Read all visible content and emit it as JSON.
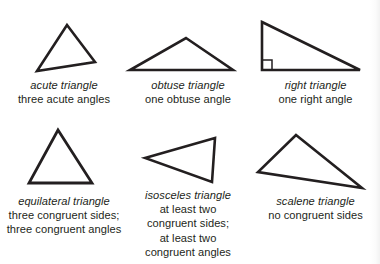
{
  "figure": {
    "ink_color": "#231f20",
    "background_color": "#ffffff"
  },
  "panels": [
    {
      "id": "acute",
      "name_label": "acute triangle",
      "description_lines": [
        "three acute angles"
      ],
      "shape": "triangle",
      "vertices": [
        [
          67,
          25
        ],
        [
          95,
          62
        ],
        [
          37,
          71
        ]
      ]
    },
    {
      "id": "obtuse",
      "name_label": "obtuse triangle",
      "description_lines": [
        "one obtuse angle"
      ],
      "shape": "triangle",
      "vertices": [
        [
          62,
          13
        ],
        [
          109,
          45
        ],
        [
          6,
          45
        ]
      ]
    },
    {
      "id": "right",
      "name_label": "right triangle",
      "description_lines": [
        "one right angle"
      ],
      "shape": "right-triangle",
      "vertices": [
        [
          11,
          22
        ],
        [
          109,
          70
        ],
        [
          11,
          70
        ]
      ],
      "right_angle_marker": true
    },
    {
      "id": "equilateral",
      "name_label": "equilateral triangle",
      "description_lines": [
        "three congruent sides;",
        "three congruent angles"
      ],
      "shape": "triangle",
      "vertices": [
        [
          58,
          10
        ],
        [
          92,
          63
        ],
        [
          29,
          63
        ]
      ]
    },
    {
      "id": "isosceles",
      "name_label": "isosceles triangle",
      "description_lines": [
        "at least two",
        "congruent sides;",
        "at least two",
        "congruent angles"
      ],
      "shape": "triangle",
      "vertices": [
        [
          21,
          38
        ],
        [
          91,
          18
        ],
        [
          88,
          62
        ]
      ]
    },
    {
      "id": "scalene",
      "name_label": "scalene triangle",
      "description_lines": [
        "no congruent sides"
      ],
      "shape": "triangle",
      "vertices": [
        [
          45,
          15
        ],
        [
          111,
          68
        ],
        [
          7,
          52
        ]
      ]
    }
  ]
}
